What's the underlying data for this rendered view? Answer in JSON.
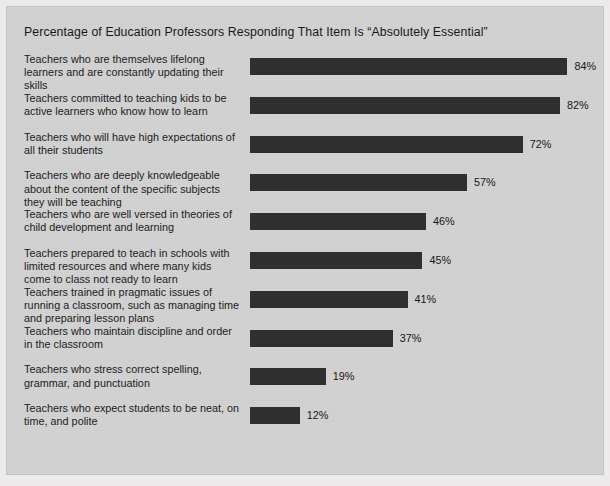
{
  "chart_data": {
    "type": "bar",
    "orientation": "horizontal",
    "title": "Percentage of Education Professors Responding That Item Is “Absolutely Essential”",
    "xlabel": "",
    "ylabel": "",
    "xlim": [
      0,
      100
    ],
    "grid": false,
    "legend": false,
    "value_suffix": "%",
    "categories": [
      "Teachers who are themselves lifelong learners and are constantly updating their skills",
      "Teachers committed to teaching kids to be active learners who know how to learn",
      "Teachers who will have high expectations of all their students",
      "Teachers who are deeply knowledgeable about the content of the specific subjects they will be teaching",
      "Teachers who are well versed in theories of child development and learning",
      "Teachers prepared to teach in schools with limited resources and where many kids come to class not ready to learn",
      "Teachers trained in pragmatic issues of running a classroom, such as managing time and preparing lesson plans",
      "Teachers who maintain discipline and order in the classroom",
      "Teachers who stress correct spelling, grammar, and punctuation",
      "Teachers who expect students to be neat, on time, and polite"
    ],
    "values": [
      84,
      82,
      72,
      57,
      46,
      45,
      41,
      37,
      19,
      12
    ],
    "value_labels": [
      "84%",
      "82%",
      "72%",
      "57%",
      "46%",
      "45%",
      "41%",
      "37%",
      "19%",
      "12%"
    ],
    "colors": {
      "bar": "#2d2d2d",
      "panel_background": "#d2d2d2",
      "figure_background": "#eceaea",
      "text": "#191919"
    }
  },
  "bars": [
    {
      "label": "Teachers who are themselves lifelong learners and are constantly updating their skills",
      "value": 84,
      "value_label": "84%"
    },
    {
      "label": "Teachers committed to teaching kids to be active learners who know how to learn",
      "value": 82,
      "value_label": "82%"
    },
    {
      "label": "Teachers who will have high expectations of all their students",
      "value": 72,
      "value_label": "72%"
    },
    {
      "label": "Teachers who are deeply knowledgeable about the content of the specific subjects they will be teaching",
      "value": 57,
      "value_label": "57%"
    },
    {
      "label": "Teachers who are well versed in theories of child development and learning",
      "value": 46,
      "value_label": "46%"
    },
    {
      "label": "Teachers prepared to teach in schools with limited resources and where many kids come to class not ready to learn",
      "value": 45,
      "value_label": "45%"
    },
    {
      "label": "Teachers trained in pragmatic issues of running a classroom, such as managing time and preparing lesson plans",
      "value": 41,
      "value_label": "41%"
    },
    {
      "label": "Teachers who maintain discipline and order in the classroom",
      "value": 37,
      "value_label": "37%"
    },
    {
      "label": "Teachers who stress correct spelling, grammar, and punctuation",
      "value": 19,
      "value_label": "19%"
    },
    {
      "label": "Teachers who expect students to be neat, on time, and polite",
      "value": 12,
      "value_label": "12%"
    }
  ]
}
